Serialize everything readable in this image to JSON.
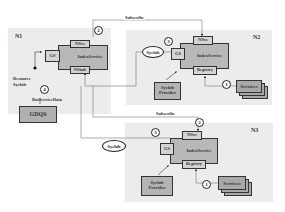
{
  "nodes": {
    "n1": {
      "label": "N1",
      "gs": "GS",
      "index_service": "IndexService",
      "nsvc": "NSvc",
      "nstub": "NStub",
      "gdqs": "GDQS",
      "resource_syclub_label_line1": "Resource",
      "resource_syclub_label_line2": "Syclub",
      "call_label": "BatServiceData",
      "step": "4"
    },
    "n2": {
      "label": "N2",
      "gs": "GS",
      "index_service": "IndexService",
      "nsvc": "NSvc",
      "registry": "Registry",
      "provider_line1": "Syclub",
      "provider_line2": "Provider",
      "services": "Services",
      "step_registry": "1",
      "step_nsvc": "3"
    },
    "n3": {
      "label": "N3",
      "gs": "GS",
      "index_service": "IndexService",
      "nsvc": "NSvc",
      "registry": "Registry",
      "provider_line1": "Syclub",
      "provider_line2": "Provider",
      "services": "Services",
      "step_registry": "1",
      "step_gs": "3",
      "step_nsvc": "2"
    }
  },
  "edges": {
    "subscribe_top": "Subscribe",
    "subscribe_mid": "Subscribe",
    "step_top": "2"
  },
  "messages": {
    "syclub_n2": "Syclub",
    "syclub_n3": "Syclub"
  }
}
